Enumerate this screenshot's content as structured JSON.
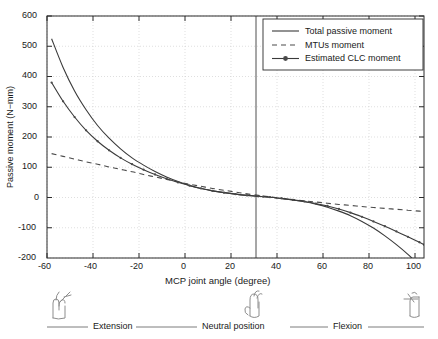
{
  "chart_data": {
    "type": "line",
    "title": "",
    "xlabel": "MCP joint angle (degree)",
    "ylabel": "Passive moment (N−mm)",
    "xlim": [
      -62,
      102
    ],
    "ylim": [
      -200,
      600
    ],
    "xticks": [
      -60,
      -40,
      -20,
      0,
      20,
      40,
      60,
      80,
      100
    ],
    "yticks": [
      -200,
      -100,
      0,
      100,
      200,
      300,
      400,
      500,
      600
    ],
    "grid": true,
    "legend_position": "top-right",
    "annotations": {
      "vertical_line_x": 32,
      "vertical_line_label": "Neutral position"
    },
    "x": [
      -60,
      -55,
      -50,
      -45,
      -40,
      -35,
      -30,
      -25,
      -20,
      -15,
      -10,
      -5,
      0,
      5,
      10,
      15,
      20,
      25,
      30,
      32,
      35,
      40,
      45,
      50,
      55,
      60,
      65,
      70,
      75,
      80,
      85,
      90,
      95,
      100,
      102
    ],
    "series": [
      {
        "name": "Total passive moment",
        "style": "solid",
        "marker": "none",
        "values": [
          525,
          430,
          352,
          290,
          238,
          196,
          161,
          131,
          107,
          86,
          68,
          53,
          40,
          30,
          22,
          16,
          11,
          7,
          4,
          3,
          1,
          -3,
          -8,
          -14,
          -22,
          -32,
          -45,
          -60,
          -79,
          -101,
          -127,
          -156,
          -188,
          -224,
          -240
        ]
      },
      {
        "name": "MTUs moment",
        "style": "dashed",
        "marker": "none",
        "values": [
          145,
          136,
          127,
          118,
          110,
          101,
          93,
          85,
          76,
          68,
          60,
          52,
          44,
          37,
          30,
          24,
          18,
          12,
          7,
          5,
          2,
          -3,
          -7,
          -11,
          -15,
          -19,
          -23,
          -26,
          -30,
          -33,
          -36,
          -39,
          -42,
          -45,
          -46
        ]
      },
      {
        "name": "Estimated CLC moment",
        "style": "solid-marker",
        "marker": "dot",
        "values": [
          380,
          318,
          266,
          222,
          186,
          156,
          131,
          110,
          92,
          76,
          62,
          50,
          39,
          30,
          22,
          16,
          11,
          7,
          4,
          3,
          1,
          -3,
          -8,
          -13,
          -20,
          -28,
          -38,
          -50,
          -64,
          -79,
          -95,
          -112,
          -130,
          -148,
          -156
        ]
      }
    ]
  },
  "legend": {
    "items": [
      {
        "label": "Total passive moment",
        "style": "solid"
      },
      {
        "label": "MTUs moment",
        "style": "dashed"
      },
      {
        "label": "Estimated CLC moment",
        "style": "solid-marker"
      }
    ]
  },
  "axes": {
    "x_title": "MCP joint angle (degree)",
    "y_title": "Passive moment (N−mm)",
    "x_tick_labels": [
      "-60",
      "-40",
      "-20",
      "0",
      "20",
      "40",
      "60",
      "80",
      "100"
    ],
    "y_tick_labels": [
      "600",
      "500",
      "400",
      "300",
      "200",
      "100",
      "0",
      "-100",
      "-200"
    ]
  },
  "bands": {
    "extension_label": "Extension",
    "neutral_label": "Neutral position",
    "flexion_label": "Flexion",
    "hand_icons": [
      "hand-extension-icon",
      "hand-neutral-icon",
      "hand-flexion-icon"
    ]
  },
  "colors": {
    "line": "#3a3a3a",
    "grid": "#c8c8c8",
    "axis": "#2b2b2b",
    "background": "#ffffff",
    "marker": "#555555"
  }
}
